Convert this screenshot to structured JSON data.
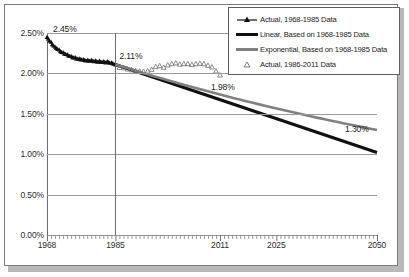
{
  "chart_data": {
    "type": "line",
    "title": "",
    "xlabel": "",
    "ylabel": "",
    "xlim": [
      1968,
      2050
    ],
    "ylim": [
      0.0,
      2.5
    ],
    "grid": true,
    "y_tick_labels": [
      "0.00%",
      "0.50%",
      "1.00%",
      "1.50%",
      "2.00%",
      "2.50%"
    ],
    "y_ticks": [
      0.0,
      0.5,
      1.0,
      1.5,
      2.0,
      2.5
    ],
    "x_tick_labels": [
      "1968",
      "1985",
      "2011",
      "2025",
      "2050"
    ],
    "x_ticks": [
      1968,
      1985,
      2011,
      2025,
      2050
    ],
    "minor_x_tick_interval": 1,
    "legend_position": "top-right",
    "reference_line_x": 1985,
    "series": [
      {
        "name": "Actual, 1968-1985 Data",
        "marker": "filled-triangle",
        "color": "#101010",
        "x": [
          1968,
          1969,
          1970,
          1971,
          1972,
          1973,
          1974,
          1975,
          1976,
          1977,
          1978,
          1979,
          1980,
          1981,
          1982,
          1983,
          1984,
          1985
        ],
        "values": [
          2.45,
          2.4,
          2.34,
          2.3,
          2.27,
          2.24,
          2.22,
          2.2,
          2.185,
          2.175,
          2.17,
          2.165,
          2.16,
          2.155,
          2.15,
          2.145,
          2.13,
          2.11
        ],
        "x_dense": [
          1968.0,
          1968.3,
          1968.6,
          1969.0,
          1969.3,
          1969.6,
          1970.0,
          1970.3,
          1970.6,
          1971.0,
          1971.3,
          1971.6,
          1972.0,
          1972.3,
          1972.6,
          1973.0,
          1973.3,
          1973.6,
          1974.0,
          1974.3,
          1974.6,
          1975.0,
          1975.3,
          1975.6,
          1976.0,
          1976.3,
          1976.6,
          1977.0,
          1977.3,
          1977.6,
          1978.0,
          1978.3,
          1978.6,
          1979.0,
          1979.3,
          1979.6,
          1980.0,
          1980.3,
          1980.6,
          1981.0,
          1981.3,
          1981.6,
          1982.0,
          1982.3,
          1982.6,
          1983.0,
          1983.3,
          1983.6,
          1984.0,
          1984.3,
          1984.6,
          1985.0
        ],
        "values_dense": [
          2.45,
          2.43,
          2.405,
          2.39,
          2.36,
          2.345,
          2.33,
          2.315,
          2.3,
          2.295,
          2.275,
          2.265,
          2.26,
          2.245,
          2.24,
          2.235,
          2.22,
          2.215,
          2.215,
          2.2,
          2.195,
          2.2,
          2.185,
          2.18,
          2.185,
          2.175,
          2.17,
          2.175,
          2.165,
          2.16,
          2.165,
          2.16,
          2.155,
          2.165,
          2.155,
          2.15,
          2.16,
          2.15,
          2.145,
          2.155,
          2.145,
          2.14,
          2.15,
          2.14,
          2.135,
          2.15,
          2.14,
          2.13,
          2.135,
          2.125,
          2.12,
          2.11
        ]
      },
      {
        "name": "Linear, Based on 1968-1985 Data",
        "type": "trend-linear",
        "color": "#101010",
        "x": [
          1985,
          2050
        ],
        "values": [
          2.11,
          1.02
        ]
      },
      {
        "name": "Exponential, Based on 1968-1985 Data",
        "type": "trend-exponential",
        "color": "#808080",
        "x": [
          1985,
          2050
        ],
        "values": [
          2.11,
          1.3
        ]
      },
      {
        "name": "Actual, 1986-2011 Data",
        "marker": "open-triangle",
        "color": "#6e6e6e",
        "x": [
          1986,
          1987,
          1988,
          1989,
          1990,
          1991,
          1992,
          1993,
          1994,
          1995,
          1996,
          1997,
          1998,
          1999,
          2000,
          2001,
          2002,
          2003,
          2004,
          2005,
          2006,
          2007,
          2008,
          2009,
          2010,
          2011
        ],
        "values": [
          2.075,
          2.07,
          2.055,
          2.045,
          2.035,
          2.03,
          2.025,
          2.03,
          2.05,
          2.085,
          2.095,
          2.075,
          2.105,
          2.12,
          2.13,
          2.115,
          2.12,
          2.12,
          2.11,
          2.12,
          2.125,
          2.12,
          2.1,
          2.08,
          2.03,
          1.98
        ]
      }
    ],
    "annotations": [
      {
        "label": "2.45%",
        "x": 1968,
        "y": 2.45
      },
      {
        "label": "2.11%",
        "x": 1985,
        "y": 2.11
      },
      {
        "label": "1.98%",
        "x": 2011,
        "y": 1.98
      },
      {
        "label": "1.30%",
        "x": 2050,
        "y": 1.3
      }
    ]
  },
  "legend": {
    "items": [
      {
        "label": "Actual, 1968-1985 Data",
        "key": "filled-triangle-marker"
      },
      {
        "label": "Linear, Based on 1968-1985 Data",
        "key": "black-line-swatch"
      },
      {
        "label": "Exponential, Based on 1968-1985 Data",
        "key": "gray-line-swatch"
      },
      {
        "label": "Actual, 1986-2011 Data",
        "key": "open-triangle-marker"
      }
    ]
  },
  "colors": {
    "series_black": "#101010",
    "series_gray": "#808080",
    "marker_open": "#6e6e6e",
    "grid": "#9a9a9a",
    "axis": "#6e6e6e",
    "frame": "#7a7a7a"
  }
}
